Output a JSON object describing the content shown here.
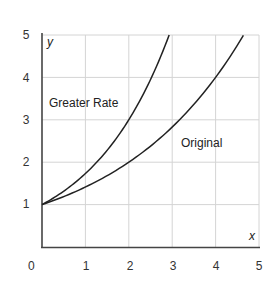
{
  "chart_data": {
    "type": "line",
    "title": "",
    "xlabel": "x",
    "ylabel": "y",
    "xlim": [
      0,
      5
    ],
    "ylim": [
      0,
      5
    ],
    "grid": true,
    "x_ticks": [
      "1",
      "2",
      "3",
      "4",
      "5"
    ],
    "y_ticks": [
      "1",
      "2",
      "3",
      "4",
      "5"
    ],
    "origin_label": "0",
    "series": [
      {
        "name": "Greater Rate",
        "x": [
          0,
          0.5,
          1,
          1.5,
          2,
          2.5,
          2.93
        ],
        "y": [
          1.0,
          1.32,
          1.73,
          2.28,
          3.0,
          3.95,
          5.0
        ]
      },
      {
        "name": "Original",
        "x": [
          0,
          0.5,
          1,
          1.5,
          2,
          2.5,
          3,
          3.5,
          4,
          4.5,
          4.64
        ],
        "y": [
          1.0,
          1.19,
          1.41,
          1.68,
          2.0,
          2.38,
          2.83,
          3.36,
          4.0,
          4.76,
          5.0
        ]
      }
    ],
    "annotations": [
      {
        "text": "Greater Rate",
        "x": 0.15,
        "y": 3.4
      },
      {
        "text": "Original",
        "x": 3.15,
        "y": 2.6
      }
    ]
  },
  "labels": {
    "greater": "Greater Rate",
    "original": "Original",
    "x_axis": "x",
    "y_axis": "y",
    "origin": "0",
    "xt": [
      "1",
      "2",
      "3",
      "4",
      "5"
    ],
    "yt": [
      "1",
      "2",
      "3",
      "4",
      "5"
    ]
  }
}
